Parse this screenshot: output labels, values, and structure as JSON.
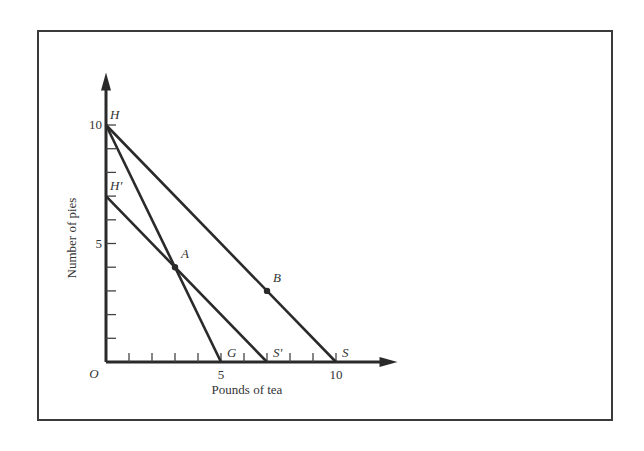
{
  "chart_data": {
    "type": "line",
    "title": "",
    "xlabel": "Pounds of tea",
    "ylabel": "Number of pies",
    "xlim": [
      0,
      12.5
    ],
    "ylim": [
      0,
      12.3
    ],
    "grid": false,
    "x_ticks": [
      1,
      2,
      3,
      4,
      5,
      6,
      7,
      8,
      9,
      10
    ],
    "y_ticks": [
      1,
      2,
      3,
      4,
      5,
      6,
      7,
      8,
      9,
      10
    ],
    "x_tick_labels": [
      {
        "value": 5,
        "label": "5"
      },
      {
        "value": 10,
        "label": "10"
      }
    ],
    "y_tick_labels": [
      {
        "value": 5,
        "label": "5"
      },
      {
        "value": 10,
        "label": "10"
      }
    ],
    "origin_label": "O",
    "series": [
      {
        "name": "HS",
        "points": [
          [
            0,
            10
          ],
          [
            10,
            0
          ]
        ]
      },
      {
        "name": "HG",
        "points": [
          [
            0,
            10
          ],
          [
            5,
            0
          ]
        ]
      },
      {
        "name": "H'S'",
        "points": [
          [
            0,
            7
          ],
          [
            7,
            0
          ]
        ]
      }
    ],
    "points": [
      {
        "name": "A",
        "x": 3,
        "y": 4,
        "label": "A"
      },
      {
        "name": "B",
        "x": 7,
        "y": 3,
        "label": "B"
      }
    ],
    "annotations": [
      {
        "label": "H",
        "x": 0,
        "y": 10
      },
      {
        "label": "H'",
        "x": 0,
        "y": 7
      },
      {
        "label": "G",
        "x": 5,
        "y": 0
      },
      {
        "label": "S'",
        "x": 7,
        "y": 0
      },
      {
        "label": "S",
        "x": 10,
        "y": 0
      }
    ]
  }
}
